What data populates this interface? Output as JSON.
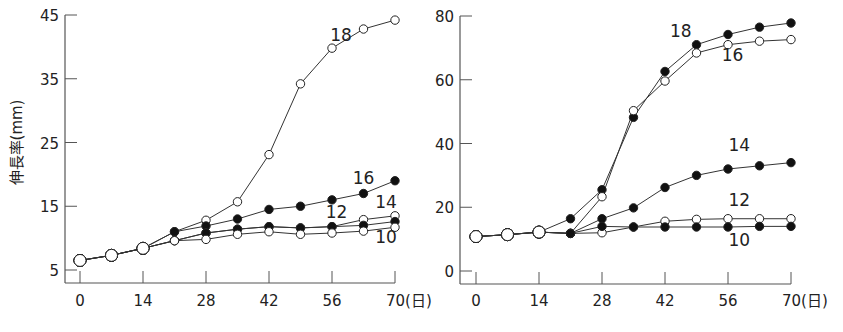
{
  "chart_data": [
    {
      "type": "line",
      "title": "",
      "ylabel": "伸長率(mm)",
      "xlabel": "(日)",
      "x": [
        0,
        7,
        14,
        21,
        28,
        35,
        42,
        49,
        56,
        63,
        70
      ],
      "xticks": [
        "0",
        "14",
        "28",
        "42",
        "56",
        "70"
      ],
      "yticks": [
        "5",
        "15",
        "25",
        "35",
        "45"
      ],
      "ylim": [
        5,
        45
      ],
      "xlim": [
        0,
        70
      ],
      "grid": false,
      "series": [
        {
          "name": "18",
          "marker": "open",
          "values": [
            6.5,
            7.3,
            8.4,
            11.0,
            12.8,
            15.7,
            23.1,
            34.2,
            39.8,
            42.8,
            44.2
          ]
        },
        {
          "name": "16",
          "marker": "filled",
          "values": [
            6.5,
            7.3,
            8.4,
            11.0,
            11.9,
            13.0,
            14.5,
            15.0,
            16.0,
            17.0,
            19.0
          ]
        },
        {
          "name": "14",
          "marker": "open",
          "values": [
            6.5,
            7.3,
            8.4,
            9.6,
            10.8,
            11.4,
            11.8,
            11.6,
            11.8,
            12.9,
            13.5
          ]
        },
        {
          "name": "12",
          "marker": "filled",
          "values": [
            6.5,
            7.3,
            8.4,
            9.6,
            10.8,
            11.4,
            11.8,
            11.6,
            11.8,
            12.0,
            12.6
          ]
        },
        {
          "name": "10",
          "marker": "open",
          "values": [
            6.5,
            7.3,
            8.4,
            9.6,
            9.8,
            10.6,
            11.0,
            10.6,
            10.8,
            11.1,
            11.7
          ]
        }
      ],
      "labels": [
        {
          "text": "18",
          "x": 58,
          "y": 41
        },
        {
          "text": "16",
          "x": 63,
          "y": 18.5
        },
        {
          "text": "14",
          "x": 68,
          "y": 14.8
        },
        {
          "text": "12",
          "x": 57,
          "y": 13.2
        },
        {
          "text": "10",
          "x": 68,
          "y": 9.2
        }
      ]
    },
    {
      "type": "line",
      "title": "",
      "ylabel": "",
      "xlabel": "(日)",
      "x": [
        0,
        7,
        14,
        21,
        28,
        35,
        42,
        49,
        56,
        63,
        70
      ],
      "xticks": [
        "0",
        "14",
        "28",
        "42",
        "56",
        "70"
      ],
      "yticks": [
        "0",
        "20",
        "40",
        "60",
        "80"
      ],
      "ylim": [
        0,
        80
      ],
      "xlim": [
        0,
        70
      ],
      "grid": false,
      "series": [
        {
          "name": "18",
          "marker": "filled",
          "values": [
            10.8,
            11.4,
            12.2,
            16.4,
            25.5,
            48.2,
            62.6,
            71.0,
            74.2,
            76.5,
            77.8
          ]
        },
        {
          "name": "16",
          "marker": "open",
          "values": [
            10.8,
            11.4,
            12.2,
            11.8,
            23.3,
            50.3,
            59.6,
            68.4,
            71.0,
            72.1,
            72.6
          ]
        },
        {
          "name": "14",
          "marker": "filled",
          "values": [
            10.8,
            11.4,
            12.2,
            11.8,
            16.4,
            19.8,
            26.2,
            30.0,
            32.0,
            33.0,
            34.0
          ]
        },
        {
          "name": "12",
          "marker": "open",
          "values": [
            10.8,
            11.4,
            12.2,
            11.8,
            12.0,
            13.8,
            15.6,
            16.2,
            16.4,
            16.4,
            16.4
          ]
        },
        {
          "name": "10",
          "marker": "filled",
          "values": [
            10.8,
            11.4,
            12.2,
            11.8,
            14.0,
            13.8,
            13.8,
            13.8,
            13.8,
            14.0,
            14.0
          ]
        }
      ],
      "labels": [
        {
          "text": "18",
          "x": 45.5,
          "y": 73.5
        },
        {
          "text": "16",
          "x": 57,
          "y": 66
        },
        {
          "text": "14",
          "x": 58.5,
          "y": 37.5
        },
        {
          "text": "12",
          "x": 58.5,
          "y": 20.5
        },
        {
          "text": "10",
          "x": 58.5,
          "y": 8
        }
      ]
    }
  ]
}
